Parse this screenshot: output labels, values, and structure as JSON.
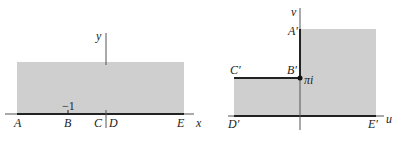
{
  "colors": {
    "shade": "#cfcfcf",
    "line": "#333333",
    "axis": "#555555",
    "background": "#ffffff"
  },
  "left_panel": {
    "axis_labels": {
      "x": "x",
      "y": "y"
    },
    "points": {
      "A": "A",
      "B": "B",
      "C": "C",
      "D": "D",
      "E": "E"
    },
    "tick_label": "−1"
  },
  "right_panel": {
    "axis_labels": {
      "u": "u",
      "v": "v"
    },
    "points": {
      "A": "A′",
      "B": "B′",
      "C": "C′",
      "D": "D′",
      "E": "E′"
    },
    "point_annotation": "πi"
  }
}
